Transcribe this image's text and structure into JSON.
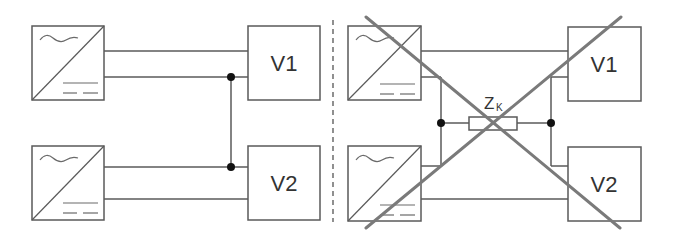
{
  "diagram": {
    "type": "circuit-comparison",
    "colors": {
      "wire": "#5a5a5a",
      "cross": "#7a7a7a",
      "junction": "#111111"
    },
    "left_panel": {
      "description": "Parallel connection of two converters with loads V1 and V2 sharing a common conductor",
      "converters": [
        {
          "id": "conv-top",
          "symbol": "AC/DC converter (~ / =)"
        },
        {
          "id": "conv-bottom",
          "symbol": "AC/DC converter (~ / =)"
        }
      ],
      "loads": [
        {
          "id": "load-v1",
          "label": "V1"
        },
        {
          "id": "load-v2",
          "label": "V2"
        }
      ],
      "junctions": 2
    },
    "right_panel": {
      "description": "Crossed-out configuration with coupling impedance between the two circuits",
      "converters": [
        {
          "id": "conv-top",
          "symbol": "AC/DC converter (~ / =)"
        },
        {
          "id": "conv-bottom",
          "symbol": "AC/DC converter (~ / =)"
        }
      ],
      "loads": [
        {
          "id": "load-v1",
          "label": "V1"
        },
        {
          "id": "load-v2",
          "label": "V2"
        }
      ],
      "impedance": {
        "label": "Z",
        "subscript": "K"
      },
      "junctions": 2,
      "crossed_out": true
    }
  }
}
